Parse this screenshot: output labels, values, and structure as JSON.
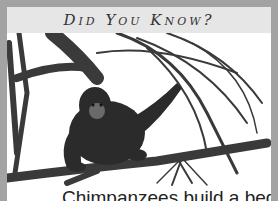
{
  "header": {
    "title": "Did You Know?"
  },
  "illustration": {
    "subject": "chimpanzee sitting on tree branches",
    "style": "pencil drawing"
  },
  "caption": {
    "text": "Chimpanzees build a bed for"
  },
  "colors": {
    "frame": "#a3a3a3",
    "header_bg": "#e6e6e6",
    "card_bg": "#ffffff",
    "text": "#222222"
  }
}
